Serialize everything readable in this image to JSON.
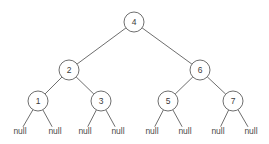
{
  "diagram": {
    "type": "binary-tree",
    "background_color": "#ffffff",
    "stroke_color": "#6e6e6e",
    "text_color": "#3b3b3b",
    "node_radius": 10,
    "leaf_text": "null",
    "nodes": [
      {
        "id": "n4",
        "label": "4",
        "x": 134,
        "y": 22,
        "level": 0
      },
      {
        "id": "n2",
        "label": "2",
        "x": 69,
        "y": 70,
        "level": 1
      },
      {
        "id": "n6",
        "label": "6",
        "x": 200,
        "y": 70,
        "level": 1
      },
      {
        "id": "n1",
        "label": "1",
        "x": 38,
        "y": 101,
        "level": 2
      },
      {
        "id": "n3",
        "label": "3",
        "x": 101,
        "y": 101,
        "level": 2
      },
      {
        "id": "n5",
        "label": "5",
        "x": 168,
        "y": 101,
        "level": 2
      },
      {
        "id": "n7",
        "label": "7",
        "x": 233,
        "y": 101,
        "level": 2
      }
    ],
    "leaves": [
      {
        "id": "l1",
        "label": "null",
        "x": 20,
        "y": 132,
        "parent": "n1"
      },
      {
        "id": "l2",
        "label": "null",
        "x": 55,
        "y": 132,
        "parent": "n1"
      },
      {
        "id": "l3",
        "label": "null",
        "x": 85,
        "y": 132,
        "parent": "n3"
      },
      {
        "id": "l4",
        "label": "null",
        "x": 118,
        "y": 132,
        "parent": "n3"
      },
      {
        "id": "l5",
        "label": "null",
        "x": 152,
        "y": 132,
        "parent": "n5"
      },
      {
        "id": "l6",
        "label": "null",
        "x": 185,
        "y": 132,
        "parent": "n5"
      },
      {
        "id": "l7",
        "label": "null",
        "x": 218,
        "y": 132,
        "parent": "n7"
      },
      {
        "id": "l8",
        "label": "null",
        "x": 251,
        "y": 132,
        "parent": "n7"
      }
    ],
    "edges": [
      {
        "from": "n4",
        "to": "n2"
      },
      {
        "from": "n4",
        "to": "n6"
      },
      {
        "from": "n2",
        "to": "n1"
      },
      {
        "from": "n2",
        "to": "n3"
      },
      {
        "from": "n6",
        "to": "n5"
      },
      {
        "from": "n6",
        "to": "n7"
      },
      {
        "from": "n1",
        "to": "l1"
      },
      {
        "from": "n1",
        "to": "l2"
      },
      {
        "from": "n3",
        "to": "l3"
      },
      {
        "from": "n3",
        "to": "l4"
      },
      {
        "from": "n5",
        "to": "l5"
      },
      {
        "from": "n5",
        "to": "l6"
      },
      {
        "from": "n7",
        "to": "l7"
      },
      {
        "from": "n7",
        "to": "l8"
      }
    ]
  }
}
